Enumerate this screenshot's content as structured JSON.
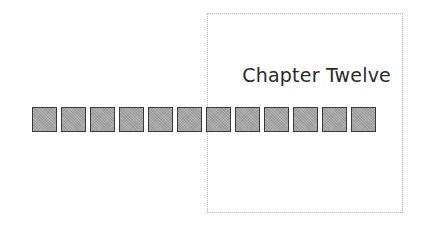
{
  "title": "Chapter Twelve",
  "squares": {
    "count": 12,
    "fill": "#a8a8a8",
    "border": "#3a3a3a"
  },
  "frame": {
    "style": "dotted",
    "color": "#b5b5b5"
  }
}
